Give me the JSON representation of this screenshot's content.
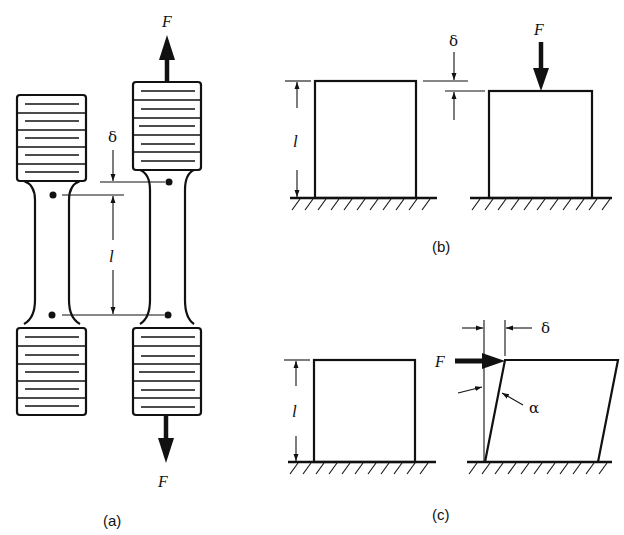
{
  "figure": {
    "panels": [
      {
        "id": "a",
        "caption": "(a)",
        "description": "tensile test specimen, unloaded and loaded",
        "labels": {
          "force_top": "F",
          "force_bottom": "F",
          "elongation": "δ",
          "gauge_length": "l"
        }
      },
      {
        "id": "b",
        "caption": "(b)",
        "description": "compression of a block",
        "labels": {
          "force": "F",
          "deformation": "δ",
          "length": "l"
        }
      },
      {
        "id": "c",
        "caption": "(c)",
        "description": "shear deformation of a block",
        "labels": {
          "force": "F",
          "displacement": "δ",
          "length": "l",
          "angle": "α"
        }
      }
    ],
    "colors": {
      "ink": "#111111",
      "background": "#ffffff"
    }
  }
}
